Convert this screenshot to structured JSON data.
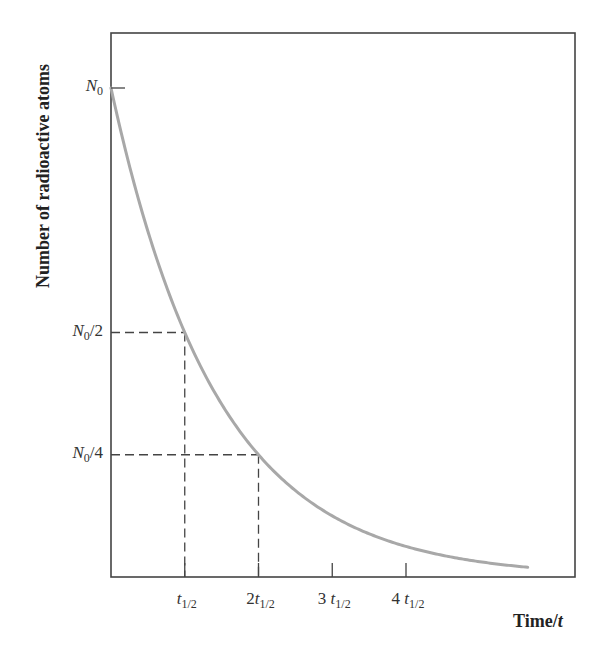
{
  "chart_data": {
    "type": "line",
    "title": "",
    "xlabel": "Time/t",
    "ylabel": "Number of radioactive atoms",
    "x_unit_label": "t1/2",
    "x_ticks": [
      {
        "value": 1,
        "label_coef": "",
        "label_var": "t",
        "label_sub": "1/2"
      },
      {
        "value": 2,
        "label_coef": "2",
        "label_var": "t",
        "label_sub": "1/2"
      },
      {
        "value": 3,
        "label_coef": "3 ",
        "label_var": "t",
        "label_sub": "1/2"
      },
      {
        "value": 4,
        "label_coef": "4 ",
        "label_var": "t",
        "label_sub": "1/2"
      }
    ],
    "y_ticks": [
      {
        "value": 1.0,
        "label_var": "N",
        "label_sub": "0",
        "label_suffix": ""
      },
      {
        "value": 0.5,
        "label_var": "N",
        "label_sub": "0",
        "label_suffix": "/2"
      },
      {
        "value": 0.25,
        "label_var": "N",
        "label_sub": "0",
        "label_suffix": "/4"
      }
    ],
    "series": [
      {
        "name": "N(t) = N0 · (1/2)^(t/t1/2)",
        "x": [
          0,
          0.5,
          1,
          1.5,
          2,
          2.5,
          3,
          3.5,
          4,
          4.5,
          5,
          5.65
        ],
        "values": [
          1.0,
          0.707,
          0.5,
          0.354,
          0.25,
          0.177,
          0.125,
          0.088,
          0.0625,
          0.044,
          0.031,
          0.02
        ],
        "color": "#a8a8a8"
      }
    ],
    "guides": [
      {
        "type": "dashed",
        "from": [
          0,
          0.5
        ],
        "to": [
          1,
          0.5
        ]
      },
      {
        "type": "dashed",
        "from": [
          1,
          0.5
        ],
        "to": [
          1,
          0
        ]
      },
      {
        "type": "dashed",
        "from": [
          0,
          0.25
        ],
        "to": [
          2,
          0.25
        ]
      },
      {
        "type": "dashed",
        "from": [
          2,
          0.25
        ],
        "to": [
          2,
          0
        ]
      }
    ],
    "xlim": [
      0,
      6.24
    ],
    "ylim": [
      0,
      1.12
    ],
    "grid": false,
    "legend": "none"
  },
  "labels": {
    "x_axis_title_main": "Time/",
    "x_axis_title_var": "t",
    "y_axis_title": "Number of radioactive atoms"
  },
  "colors": {
    "axis": "#444444",
    "curve": "#a8a8a8",
    "guide": "#444444",
    "text": "#333333"
  }
}
